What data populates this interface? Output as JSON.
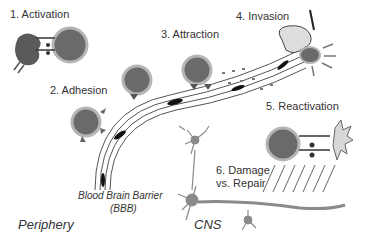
{
  "diagram": {
    "steps": [
      {
        "label": "1. Activation"
      },
      {
        "label": "2. Adhesion"
      },
      {
        "label": "3. Attraction"
      },
      {
        "label": "4. Invasion"
      },
      {
        "label": "5. Reactivation"
      },
      {
        "label": "6. Damage",
        "label2": "vs. Repair"
      }
    ],
    "bbb": {
      "line1": "Blood Brain Barrier",
      "line2": "(BBB)"
    },
    "regions": {
      "periphery": "Periphery",
      "cns": "CNS"
    },
    "colors": {
      "cell_fill": "#6a6a6a",
      "cell_ring": "#b5b5b5",
      "dark": "#222222",
      "neuron": "#8a8a8a"
    }
  }
}
